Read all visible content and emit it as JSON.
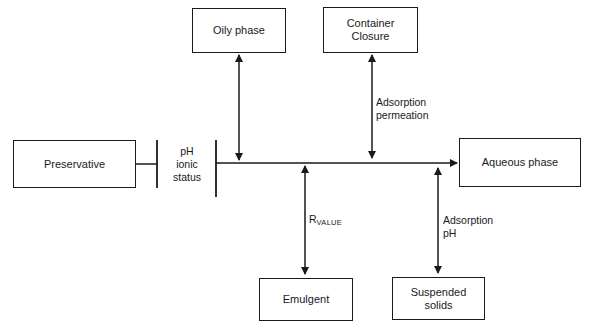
{
  "diagram": {
    "nodes": {
      "preservative": {
        "label": "Preservative"
      },
      "oily_phase": {
        "label": "Oily phase"
      },
      "container_closure": {
        "line1": "Container",
        "line2": "Closure"
      },
      "aqueous_phase": {
        "label": "Aqueous phase"
      },
      "emulgent": {
        "label": "Emulgent"
      },
      "suspended_solids": {
        "line1": "Suspended",
        "line2": "solids"
      }
    },
    "barrier_label": {
      "line1": "pH",
      "line2": "ionic",
      "line3": "status"
    },
    "edge_labels": {
      "container": {
        "line1": "Adsorption",
        "line2": "permeation"
      },
      "emulgent": {
        "main": "R",
        "subscript": "VALUE"
      },
      "suspended": {
        "line1": "Adsorption",
        "line2": "pH"
      }
    }
  }
}
